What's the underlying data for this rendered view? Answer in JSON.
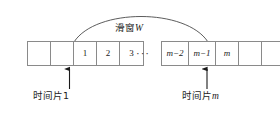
{
  "diagram": {
    "window_label": {
      "text_cn": "滑窗",
      "symbol": "W",
      "full": "滑窗W"
    },
    "ellipsis": "···",
    "strips": {
      "left": {
        "name": "left-cell-group",
        "cells": [
          {
            "label": "",
            "italic": false,
            "wide": false
          },
          {
            "label": "",
            "italic": false,
            "wide": false
          },
          {
            "label": "1",
            "italic": false,
            "wide": false
          },
          {
            "label": "2",
            "italic": false,
            "wide": false
          },
          {
            "label": "3",
            "italic": false,
            "wide": false
          }
        ]
      },
      "right": {
        "name": "right-cell-group",
        "cells": [
          {
            "label": "m−2",
            "italic": true,
            "wide": true
          },
          {
            "label": "m−1",
            "italic": true,
            "wide": true
          },
          {
            "label": "m",
            "italic": true,
            "wide": false
          },
          {
            "label": "",
            "italic": false,
            "wide": false
          },
          {
            "label": "",
            "italic": false,
            "wide": false
          }
        ]
      }
    },
    "annotations": [
      {
        "id": "slice-first",
        "text_cn": "时间片",
        "symbol": "1",
        "full": "时间片1",
        "points_to_cell": "1"
      },
      {
        "id": "slice-last",
        "text_cn": "时间片",
        "symbol": "m",
        "full": "时间片m",
        "points_to_cell": "m"
      }
    ],
    "colors": {
      "stroke": "#8a8a8a",
      "arc": "#4a4a4a",
      "arrow": "#1a1a1a",
      "text": "#1c1c1c",
      "background": "#ffffff"
    }
  }
}
